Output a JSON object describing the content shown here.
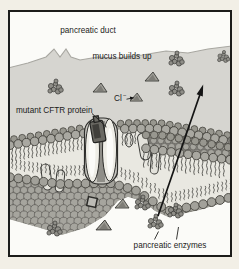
{
  "figure": {
    "labels": {
      "duct": "pancreatic duct",
      "mucus": "mucus builds up",
      "chloride": "Cl",
      "chloride_sup": "−",
      "cftr": "mutant CFTR protein",
      "enzymes": "pancreatic enzymes"
    },
    "icons": {
      "chloride_ion": "triangle-icon",
      "enzyme": "molecule-cluster-icon",
      "secretion": "arrow-up-icon"
    },
    "colors": {
      "outer_bg": "#f2efe6",
      "frame_border": "#1c1c1a",
      "inner_bg": "#fbfbf8",
      "mucus": "#d6d5d0",
      "mucus_edge": "#a8a7a1",
      "membrane_head": "#a9a8a1",
      "membrane_head_stroke": "#46453f",
      "head_back": "#98978f",
      "tails_bg": "#e9e8e1",
      "tail_stroke": "#3c3c38",
      "cobble_bg": "#85847e",
      "cobble_circle": "#a6a59e",
      "pillar": "#e3e2db",
      "protein_body": "#c7c6c0",
      "protein_lobe": "#eeede6",
      "protein_inner": "#fbfbf8",
      "protein_channel": "#8f8e88",
      "plug": "#6a6963",
      "plug_inner": "#403f3b",
      "ion": "#a09f98",
      "ion_shade": "#7e7d77",
      "enzyme": "#8f8e88",
      "square": "#bcbbb5",
      "arrow": "#141414",
      "text": "#1b1b1a"
    }
  }
}
